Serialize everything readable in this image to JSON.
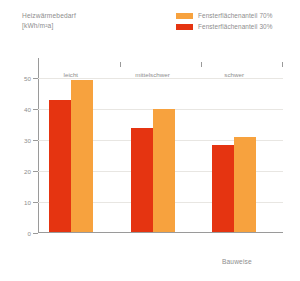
{
  "chart_data": {
    "type": "bar",
    "title": "",
    "ylabel": "Heizwärmebedarf [kWh/m²a]",
    "ylabel_line1": "Heizwärmebedarf",
    "ylabel_line2": "[kWh/m²a]",
    "xlabel": "Bauweise",
    "categories": [
      "leicht",
      "mittelschwer",
      "schwer"
    ],
    "series": [
      {
        "name": "Fensterflächenanteil 70%",
        "color": "#F7A23E",
        "values": [
          49,
          39.5,
          30.5
        ]
      },
      {
        "name": "Fensterflächenanteil 30%",
        "color": "#E53411",
        "values": [
          42.5,
          33.5,
          28
        ]
      }
    ],
    "ylim": [
      0,
      55
    ],
    "yticks": [
      0,
      10,
      20,
      30,
      40,
      50
    ],
    "ytick_labels": [
      "0",
      "10",
      "20",
      "30",
      "40",
      "50"
    ],
    "grid": true,
    "legend_position": "top-right"
  },
  "legend": {
    "items": [
      {
        "label": "Fensterflächenanteil 70%",
        "color": "#F7A23E"
      },
      {
        "label": "Fensterflächenanteil 30%",
        "color": "#E53411"
      }
    ]
  }
}
